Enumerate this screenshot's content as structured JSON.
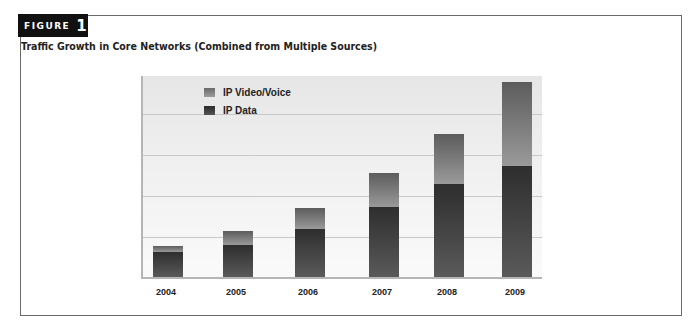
{
  "figure": {
    "label": "FIGURE",
    "number": "1",
    "title": "Traffic Growth in Core Networks (Combined from Multiple Sources)"
  },
  "legend": [
    {
      "name": "IP Video/Voice",
      "color": "#8a8a8a"
    },
    {
      "name": "IP Data",
      "color": "#3a3a3a"
    }
  ],
  "chart_data": {
    "type": "bar",
    "stacked": true,
    "title": "Traffic Growth in Core Networks (Combined from Multiple Sources)",
    "xlabel": "",
    "ylabel": "",
    "y_units": "relative (gridline units; no y-axis labels shown)",
    "categories": [
      "2004",
      "2005",
      "2006",
      "2007",
      "2008",
      "2009"
    ],
    "series": [
      {
        "name": "IP Data",
        "values": [
          0.61,
          0.78,
          1.17,
          1.71,
          2.27,
          2.71
        ]
      },
      {
        "name": "IP Video/Voice",
        "values": [
          0.15,
          0.34,
          0.51,
          0.83,
          1.22,
          2.05
        ]
      }
    ],
    "totals": [
      0.76,
      1.12,
      1.68,
      2.54,
      3.49,
      4.76
    ],
    "ylim": [
      0,
      5
    ],
    "grid": true,
    "legend_position": "top-left inside plot"
  }
}
